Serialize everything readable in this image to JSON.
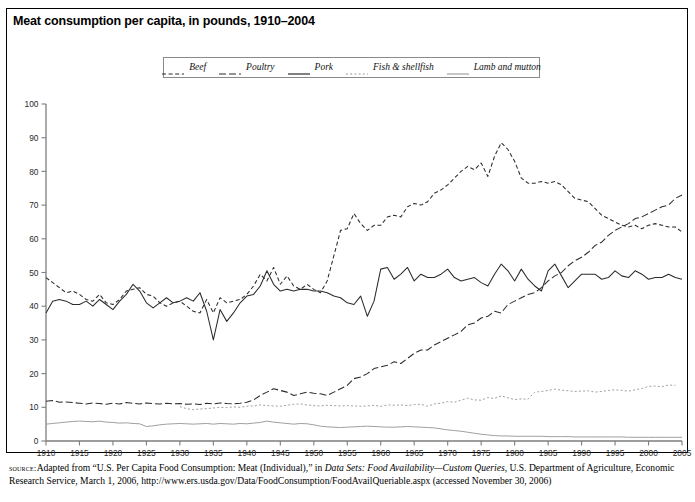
{
  "figure": {
    "title": "Meat consumption per capita, in pounds, 1910–2004",
    "source_label": "source:",
    "source_part1": "Adapted from “U.S. Per Capita Food Consumption: Meat (Individual),” in ",
    "source_italic1": "Data Sets: Food Availability—Custom Queries",
    "source_part2": ", U.S. Department of Agriculture, Economic Research Service, March 1, 2006, http://www.ers.usda.gov/Data/FoodConsumption/FoodAvailQueriable.aspx (accessed November 30, 2006)"
  },
  "chart_data": {
    "type": "line",
    "title": "Meat consumption per capita, in pounds, 1910–2004",
    "xlabel": "",
    "ylabel": "",
    "xlim": [
      1910,
      2005
    ],
    "ylim": [
      0,
      100
    ],
    "ytick_step": 10,
    "xtick_step": 5,
    "grid": false,
    "legend_position": "top-center",
    "yticks": [
      0,
      10,
      20,
      30,
      40,
      50,
      60,
      70,
      80,
      90,
      100
    ],
    "xticks": [
      1910,
      1915,
      1920,
      1925,
      1930,
      1935,
      1940,
      1945,
      1950,
      1955,
      1960,
      1965,
      1970,
      1975,
      1980,
      1985,
      1990,
      1995,
      2000,
      2005
    ],
    "series": [
      {
        "name": "Beef",
        "style": "dashed-short",
        "color": "#2b2b2b",
        "x_start": 1910,
        "values": [
          48.5,
          47.0,
          45.5,
          44.0,
          44.5,
          43.5,
          42.0,
          41.5,
          43.5,
          41.0,
          40.5,
          42.0,
          44.5,
          45.0,
          45.5,
          43.5,
          43.0,
          41.0,
          40.0,
          41.0,
          41.5,
          40.0,
          38.5,
          38.0,
          42.0,
          38.0,
          42.5,
          41.0,
          41.5,
          42.0,
          43.5,
          46.0,
          49.5,
          47.5,
          51.5,
          46.5,
          49.0,
          46.0,
          45.0,
          46.5,
          45.0,
          44.0,
          47.5,
          55.0,
          62.5,
          63.0,
          67.5,
          64.5,
          62.5,
          64.0,
          64.0,
          66.5,
          67.0,
          66.5,
          69.5,
          70.5,
          70.0,
          71.0,
          73.5,
          74.5,
          76.0,
          78.0,
          80.0,
          81.5,
          80.5,
          82.5,
          78.5,
          84.5,
          88.5,
          86.5,
          83.0,
          78.0,
          76.5,
          76.5,
          77.0,
          76.5,
          77.0,
          76.0,
          74.0,
          72.0,
          71.5,
          71.0,
          69.0,
          67.0,
          66.0,
          65.0,
          64.0,
          63.5,
          64.0,
          63.0,
          64.0,
          64.5,
          64.0,
          63.5,
          63.5,
          62.0
        ]
      },
      {
        "name": "Poultry",
        "style": "dashed-long",
        "color": "#2b2b2b",
        "x_start": 1910,
        "values": [
          11.8,
          12.0,
          11.5,
          11.6,
          11.4,
          11.2,
          11.0,
          11.3,
          11.1,
          10.9,
          11.2,
          11.0,
          11.4,
          11.2,
          11.0,
          11.3,
          11.1,
          11.0,
          11.2,
          11.0,
          11.1,
          10.9,
          11.0,
          10.8,
          11.2,
          11.0,
          11.3,
          11.1,
          11.0,
          11.2,
          11.5,
          12.2,
          13.5,
          14.5,
          15.5,
          15.0,
          14.5,
          13.5,
          14.0,
          14.5,
          14.2,
          14.0,
          13.5,
          14.5,
          15.5,
          16.5,
          18.5,
          19.0,
          20.0,
          21.5,
          22.0,
          22.5,
          23.5,
          23.0,
          24.5,
          26.0,
          27.0,
          27.0,
          28.5,
          29.5,
          30.5,
          31.5,
          32.5,
          34.5,
          35.0,
          36.5,
          37.0,
          38.5,
          38.0,
          40.5,
          41.5,
          42.5,
          43.5,
          44.0,
          45.5,
          47.5,
          49.0,
          50.0,
          52.0,
          53.5,
          54.5,
          56.0,
          58.0,
          59.0,
          61.0,
          62.5,
          63.5,
          64.5,
          66.0,
          66.5,
          67.5,
          68.5,
          69.5,
          70.0,
          72.0,
          73.0
        ]
      },
      {
        "name": "Pork",
        "style": "solid",
        "color": "#2b2b2b",
        "x_start": 1910,
        "values": [
          38.0,
          41.5,
          42.0,
          41.5,
          40.5,
          40.5,
          41.5,
          40.0,
          42.0,
          40.5,
          39.0,
          41.5,
          43.5,
          46.5,
          44.5,
          41.0,
          39.5,
          41.0,
          42.5,
          41.0,
          41.5,
          42.5,
          41.5,
          44.0,
          38.5,
          30.0,
          39.0,
          35.5,
          38.0,
          41.0,
          43.0,
          43.5,
          46.0,
          50.5,
          46.5,
          44.5,
          45.0,
          44.5,
          45.0,
          45.0,
          44.5,
          44.5,
          44.0,
          43.0,
          42.5,
          41.0,
          40.5,
          43.0,
          37.0,
          41.5,
          51.0,
          51.5,
          48.0,
          49.5,
          51.5,
          47.5,
          49.5,
          48.5,
          48.5,
          49.5,
          51.0,
          48.5,
          47.5,
          48.0,
          48.5,
          47.0,
          46.0,
          49.5,
          52.5,
          50.5,
          47.5,
          51.0,
          48.0,
          46.0,
          44.5,
          50.5,
          52.5,
          49.0,
          45.5,
          47.5,
          49.5,
          49.5,
          49.5,
          48.0,
          48.5,
          50.5,
          49.0,
          48.5,
          50.5,
          49.5,
          48.0,
          48.5,
          48.5,
          49.5,
          48.5,
          48.0
        ]
      },
      {
        "name": "Fish & shellfish",
        "style": "dotted",
        "color": "#9a9a9a",
        "x_start": 1930,
        "values": [
          10.2,
          9.6,
          9.3,
          9.5,
          9.6,
          9.8,
          10.0,
          9.9,
          10.1,
          10.0,
          10.3,
          10.4,
          10.7,
          10.5,
          10.4,
          10.3,
          10.6,
          10.9,
          11.0,
          10.7,
          10.5,
          10.4,
          10.6,
          10.5,
          10.4,
          10.5,
          10.4,
          10.3,
          10.4,
          10.6,
          10.3,
          10.7,
          10.6,
          10.7,
          10.5,
          10.8,
          10.9,
          10.3,
          11.0,
          11.2,
          11.7,
          11.5,
          12.1,
          12.7,
          12.2,
          12.1,
          12.9,
          12.6,
          13.4,
          12.8,
          12.3,
          12.5,
          12.4,
          14.5,
          14.7,
          15.0,
          15.4,
          15.1,
          14.9,
          14.7,
          14.8,
          14.9,
          14.5,
          14.7,
          15.0,
          15.2,
          15.0,
          14.8,
          15.2,
          15.6,
          16.2,
          16.3,
          16.1,
          16.6,
          16.5
        ]
      },
      {
        "name": "Lamb and mutton",
        "style": "solid-gray",
        "color": "#9a9a9a",
        "x_start": 1910,
        "values": [
          5.0,
          5.2,
          5.4,
          5.6,
          5.8,
          5.9,
          5.8,
          5.7,
          5.9,
          5.6,
          5.5,
          5.3,
          5.4,
          5.2,
          5.1,
          4.3,
          4.5,
          4.8,
          5.0,
          5.1,
          5.2,
          5.1,
          5.0,
          5.1,
          5.2,
          5.0,
          5.2,
          5.1,
          5.0,
          5.2,
          5.1,
          5.3,
          5.5,
          5.9,
          5.6,
          5.4,
          5.2,
          5.0,
          5.2,
          5.1,
          4.8,
          4.4,
          4.2,
          4.1,
          4.0,
          4.1,
          4.2,
          4.3,
          4.4,
          4.3,
          4.2,
          4.1,
          4.1,
          4.2,
          4.3,
          4.2,
          4.1,
          4.0,
          3.9,
          3.6,
          3.3,
          3.1,
          2.9,
          2.6,
          2.3,
          2.0,
          1.8,
          1.6,
          1.5,
          1.5,
          1.4,
          1.4,
          1.4,
          1.4,
          1.4,
          1.3,
          1.3,
          1.3,
          1.3,
          1.2,
          1.2,
          1.2,
          1.2,
          1.2,
          1.2,
          1.2,
          1.2,
          1.1,
          1.1,
          1.1,
          1.1,
          1.1,
          1.1,
          1.1,
          1.1,
          1.1
        ]
      }
    ]
  },
  "legend": {
    "items": [
      {
        "label": "Beef",
        "style": "dashed-short",
        "color": "#2b2b2b"
      },
      {
        "label": "Poultry",
        "style": "dashed-long",
        "color": "#2b2b2b"
      },
      {
        "label": "Pork",
        "style": "solid",
        "color": "#2b2b2b"
      },
      {
        "label": "Fish & shellfish",
        "style": "dotted",
        "color": "#9a9a9a"
      },
      {
        "label": "Lamb and mutton",
        "style": "solid-gray",
        "color": "#9a9a9a"
      }
    ]
  }
}
